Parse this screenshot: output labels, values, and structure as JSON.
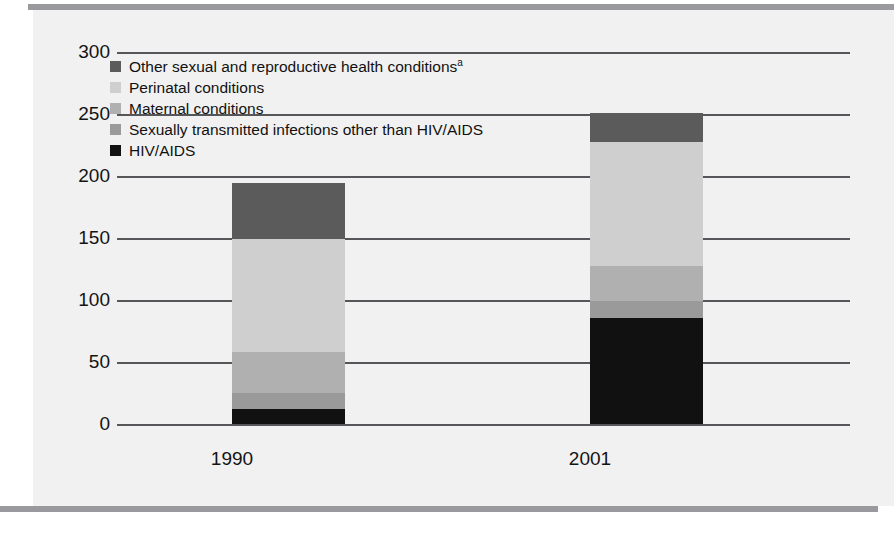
{
  "chart_data": {
    "type": "bar",
    "subtype": "stacked",
    "title": "",
    "subtitle": "",
    "xlabel": "",
    "ylabel": "",
    "categories": [
      "1990",
      "2001"
    ],
    "ylim": [
      0,
      300
    ],
    "yticks": [
      0,
      50,
      100,
      150,
      200,
      250,
      300
    ],
    "ytick_labels": [
      "0",
      "50",
      "100",
      "150",
      "200",
      "250",
      "300"
    ],
    "grid": true,
    "grid_axis": "y",
    "legend_position": "upper-left-inside",
    "stack_order_bottom_to_top": [
      "HIV/AIDS",
      "Sexually transmitted infections other than HIV/AIDS",
      "Maternal conditions",
      "Perinatal conditions",
      "Other sexual and reproductive health conditions"
    ],
    "series": [
      {
        "name": "Other sexual and reproductive health conditions",
        "legend_label": "Other sexual and reproductive health conditions",
        "legend_superscript": "a",
        "color": "#5b5b5b",
        "values": [
          45,
          23
        ]
      },
      {
        "name": "Perinatal conditions",
        "legend_label": "Perinatal conditions",
        "legend_superscript": "",
        "color": "#cfcfcf",
        "values": [
          91,
          100
        ]
      },
      {
        "name": "Maternal conditions",
        "legend_label": "Maternal conditions",
        "legend_superscript": "",
        "color": "#b0b0b0",
        "values": [
          33,
          28
        ]
      },
      {
        "name": "Sexually transmitted infections other than HIV/AIDS",
        "legend_label": "Sexually transmitted infections other than HIV/AIDS",
        "legend_superscript": "",
        "color": "#9a9a9a",
        "values": [
          13,
          14
        ]
      },
      {
        "name": "HIV/AIDS",
        "legend_label": "HIV/AIDS",
        "legend_superscript": "",
        "color": "#111111",
        "values": [
          13,
          86
        ]
      }
    ],
    "totals": [
      195,
      251
    ]
  },
  "colors": {
    "grid": "#55565a",
    "axis": "#55565a",
    "panel_background": "#f1f1f1",
    "rule": "#9a9a9e",
    "text": "#141414"
  }
}
